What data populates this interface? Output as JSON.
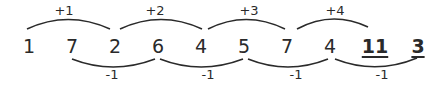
{
  "sequence": {
    "numbers": [
      {
        "value": "1",
        "x": 29,
        "underlined": false
      },
      {
        "value": "7",
        "x": 72,
        "underlined": false
      },
      {
        "value": "2",
        "x": 115,
        "underlined": false
      },
      {
        "value": "6",
        "x": 158,
        "underlined": false
      },
      {
        "value": "4",
        "x": 201,
        "underlined": false
      },
      {
        "value": "5",
        "x": 244,
        "underlined": false
      },
      {
        "value": "7",
        "x": 287,
        "underlined": false
      },
      {
        "value": "4",
        "x": 330,
        "underlined": false
      },
      {
        "value": "11",
        "x": 375,
        "underlined": true
      },
      {
        "value": "3",
        "x": 418,
        "underlined": true
      }
    ],
    "top_arcs": [
      {
        "label": "+1",
        "from": "1",
        "to": "2",
        "x1": 27,
        "x2": 110,
        "label_x": 64
      },
      {
        "label": "+2",
        "from": "2",
        "to": "4",
        "x1": 120,
        "x2": 202,
        "label_x": 155
      },
      {
        "label": "+3",
        "from": "4",
        "to": "7",
        "x1": 208,
        "x2": 285,
        "label_x": 249
      },
      {
        "label": "+4",
        "from": "7",
        "to": "11",
        "x1": 297,
        "x2": 368,
        "label_x": 335
      }
    ],
    "bottom_arcs": [
      {
        "label": "-1",
        "from": "7",
        "to": "6",
        "x1": 72,
        "x2": 155,
        "label_x": 112
      },
      {
        "label": "-1",
        "from": "6",
        "to": "5",
        "x1": 160,
        "x2": 243,
        "label_x": 208
      },
      {
        "label": "-1",
        "from": "5",
        "to": "4",
        "x1": 248,
        "x2": 328,
        "label_x": 296
      },
      {
        "label": "-1",
        "from": "4",
        "to": "3",
        "x1": 335,
        "x2": 417,
        "label_x": 382
      }
    ]
  },
  "colors": {
    "ink": "#2a2a2a",
    "background": "#ffffff"
  }
}
